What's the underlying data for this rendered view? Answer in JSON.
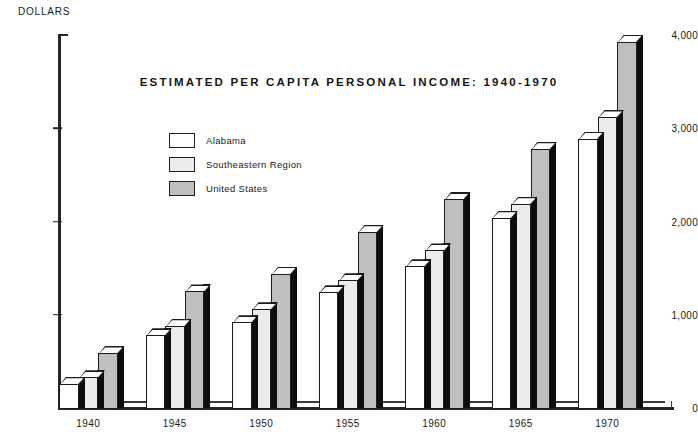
{
  "chart_data": {
    "type": "bar",
    "title": "ESTIMATED PER CAPITA PERSONAL INCOME: 1940-1970",
    "xlabel": "",
    "ylabel": "DOLLARS",
    "categories": [
      "1940",
      "1945",
      "1950",
      "1955",
      "1960",
      "1965",
      "1970"
    ],
    "series": [
      {
        "name": "Alabama",
        "color": "#ffffff",
        "values": [
          260,
          780,
          920,
          1240,
          1520,
          2040,
          2890
        ]
      },
      {
        "name": "Southeastern Region",
        "color": "#ececec",
        "values": [
          330,
          880,
          1060,
          1370,
          1690,
          2190,
          3120
        ]
      },
      {
        "name": "United States",
        "color": "#bfbfbf",
        "values": [
          590,
          1250,
          1440,
          1890,
          2240,
          2780,
          3930
        ]
      }
    ],
    "ylim": [
      0,
      4000
    ],
    "ytick_values": [
      0,
      1000,
      2000,
      3000,
      4000
    ],
    "ytick_labels": [
      "0",
      "1,000",
      "2,000",
      "3,000",
      "4,000"
    ],
    "grid": false,
    "legend_position": "inside-upper-left",
    "bar_outline_color": "#1c1c1c",
    "bar_shadow_color": "#0d0d0d",
    "axis_color": "#262626"
  },
  "axis": {
    "unit_label": "DOLLARS"
  }
}
